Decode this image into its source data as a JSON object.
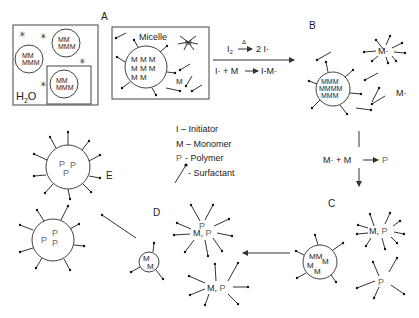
{
  "labels": {
    "A": "A",
    "B": "B",
    "C": "C",
    "D": "D",
    "E": "E",
    "micelle": "Micelle",
    "water": "H",
    "water_sub": "2",
    "water_tail": "O"
  },
  "reactions": {
    "r1_left": "I",
    "r1_sub": "2",
    "r1_heat": "Δ",
    "r1_right": "2 I·",
    "r2": "I· + M",
    "r2_right": "I-M·",
    "r3_left": "M· + M",
    "r3_right": "P"
  },
  "legend": {
    "initiator": "I – Initiator",
    "monomer": "M – Monomer",
    "polymer_symbol": "P",
    "polymer": "- Polymer",
    "surfactant": "- Surfactant"
  },
  "species": {
    "M": "M",
    "P": "P",
    "Mrad": "M·",
    "MP": "M, P"
  }
}
